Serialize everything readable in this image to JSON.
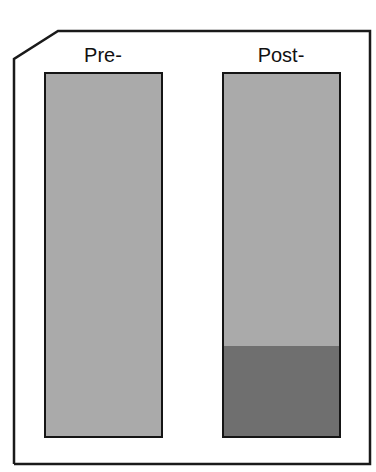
{
  "figure": {
    "labels": {
      "pre": "Pre-",
      "post": "Post-"
    },
    "colors": {
      "frame": "#1a1a1a",
      "light_fill": "#aaaaaa",
      "dark_fill": "#6f6f6f",
      "bar_border": "#151515"
    },
    "bars": [
      {
        "name": "Pre-",
        "segments": [
          {
            "fraction": 1.0,
            "shade": "light"
          }
        ]
      },
      {
        "name": "Post-",
        "segments": [
          {
            "fraction": 0.745,
            "shade": "light"
          },
          {
            "fraction": 0.255,
            "shade": "dark"
          }
        ]
      }
    ]
  }
}
